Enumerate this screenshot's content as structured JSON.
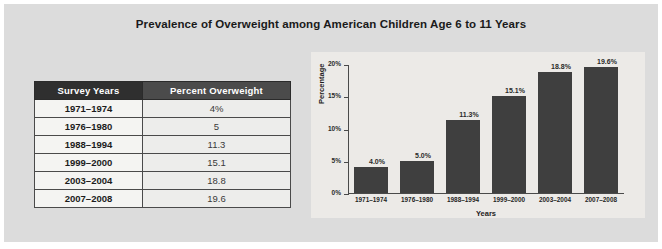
{
  "figure": {
    "title": "Prevalence of Overweight among American Children Age 6 to 11 Years",
    "panel_color": "#dcdcdc",
    "chart_panel_color": "#eceae7"
  },
  "table": {
    "headers": [
      "Survey Years",
      "Percent Overweight"
    ],
    "header_colors": [
      "#2f2f2f",
      "#4b4b4b"
    ],
    "rows": [
      {
        "years": "1971–1974",
        "percent": "4%"
      },
      {
        "years": "1976–1980",
        "percent": "5"
      },
      {
        "years": "1988–1994",
        "percent": "11.3"
      },
      {
        "years": "1999–2000",
        "percent": "15.1"
      },
      {
        "years": "2003–2004",
        "percent": "18.8"
      },
      {
        "years": "2007–2008",
        "percent": "19.6"
      }
    ]
  },
  "chart_data": {
    "type": "bar",
    "title": "",
    "xlabel": "Years",
    "ylabel": "Percentage",
    "categories": [
      "1971–1974",
      "1976–1980",
      "1988–1994",
      "1999–2000",
      "2003–2004",
      "2007–2008"
    ],
    "values": [
      4.0,
      5.0,
      11.3,
      15.1,
      18.8,
      19.6
    ],
    "data_labels": [
      "4.0%",
      "5.0%",
      "11.3%",
      "15.1%",
      "18.8%",
      "19.6%"
    ],
    "ylim": [
      0,
      20
    ],
    "yticks": [
      0,
      5,
      10,
      15,
      20
    ],
    "ytick_labels": [
      "0%",
      "5%",
      "10%",
      "15%",
      "20%"
    ],
    "grid": false,
    "legend": null,
    "bar_color": "#3f3f3f"
  }
}
